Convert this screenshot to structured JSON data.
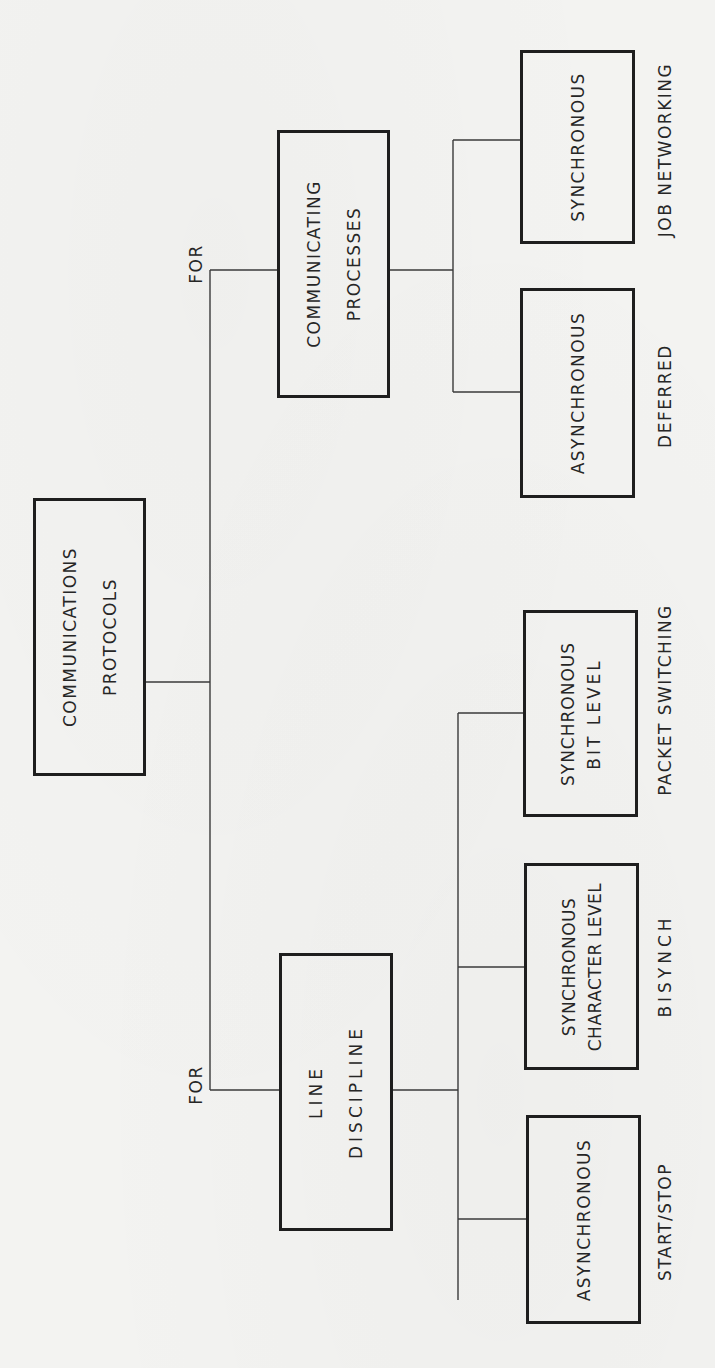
{
  "diagram": {
    "orientation": "rotated 90° counter-clockwise (text reads bottom-to-top)",
    "root": {
      "lines": [
        "COMMUNICATIONS",
        "PROTOCOLS"
      ]
    },
    "branches": [
      {
        "connector_label": "FOR",
        "node": {
          "lines": [
            "COMMUNICATING",
            "PROCESSES"
          ]
        },
        "children": [
          {
            "lines": [
              "SYNCHRONOUS"
            ],
            "example": "JOB NETWORKING"
          },
          {
            "lines": [
              "ASYNCHRONOUS"
            ],
            "example": "DEFERRED"
          }
        ]
      },
      {
        "connector_label": "FOR",
        "node": {
          "lines": [
            "LINE",
            "DISCIPLINE"
          ]
        },
        "children": [
          {
            "lines": [
              "SYNCHRONOUS",
              "BIT LEVEL"
            ],
            "example": "PACKET SWITCHING"
          },
          {
            "lines": [
              "SYNCHRONOUS",
              "CHARACTER LEVEL"
            ],
            "example": "BISYNCH"
          },
          {
            "lines": [
              "ASYNCHRONOUS"
            ],
            "example": "START/STOP"
          }
        ]
      }
    ]
  },
  "colors": {
    "background": "#f3f3f1",
    "ink": "#1e1e1e",
    "connector": "#3a3a3a"
  }
}
